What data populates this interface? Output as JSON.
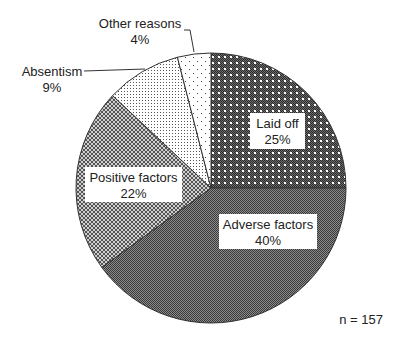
{
  "chart_data": {
    "type": "pie",
    "title": "",
    "start_angle_deg": 0,
    "direction": "clockwise",
    "slices": [
      {
        "label": "Laid off",
        "value": 25,
        "pct_label": "25%",
        "pattern": "dark-checker-with-white-dots"
      },
      {
        "label": "Adverse factors",
        "value": 40,
        "pct_label": "40%",
        "pattern": "dark-fine-checker"
      },
      {
        "label": "Positive factors",
        "value": 22,
        "pct_label": "22%",
        "pattern": "medium-diamond-checker"
      },
      {
        "label": "Absentism",
        "value": 9,
        "pct_label": "9%",
        "pattern": "fine-dots"
      },
      {
        "label": "Other reasons",
        "value": 4,
        "pct_label": "4%",
        "pattern": "sparse-dots"
      }
    ],
    "annotations": [
      "n = 157"
    ],
    "legend": "none (labels placed on/next to slices)"
  },
  "labels": {
    "laid_off": {
      "name": "Laid off",
      "pct": "25%"
    },
    "adverse": {
      "name": "Adverse factors",
      "pct": "40%"
    },
    "positive": {
      "name": "Positive factors",
      "pct": "22%"
    },
    "absentism": {
      "name": "Absentism",
      "pct": "9%"
    },
    "other": {
      "name": "Other reasons",
      "pct": "4%"
    }
  },
  "sample_size": "n = 157",
  "colors": {
    "outline": "#333333",
    "text": "#222222",
    "background": "#ffffff"
  }
}
